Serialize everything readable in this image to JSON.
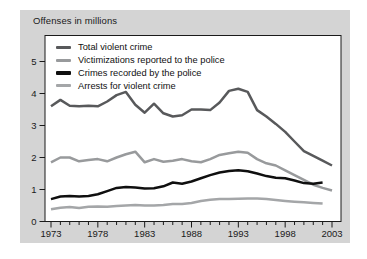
{
  "card": {
    "background": "#d4d4d4"
  },
  "chart_data": {
    "type": "line",
    "title": "Offenses in millions",
    "xlabel": "",
    "ylabel": "Offenses in millions",
    "x_start": 1973,
    "x_end": 2003,
    "x_ticks": [
      1973,
      1978,
      1983,
      1988,
      1993,
      1998,
      2003
    ],
    "y_ticks": [
      0,
      1,
      2,
      3,
      4,
      5
    ],
    "ylim": [
      0,
      5.8
    ],
    "grid": false,
    "legend_position": "top-left-inside",
    "plot_background": "#ffffff",
    "axis_color": "#1a1a1a",
    "series": [
      {
        "name": "Total violent crime",
        "color": "#58595b",
        "start_year": 1973,
        "values": [
          3.6,
          3.8,
          3.62,
          3.6,
          3.62,
          3.6,
          3.75,
          3.95,
          4.05,
          3.65,
          3.4,
          3.68,
          3.38,
          3.28,
          3.32,
          3.5,
          3.5,
          3.48,
          3.72,
          4.08,
          4.15,
          4.05,
          3.48,
          3.28,
          3.05,
          2.8,
          2.5,
          2.2,
          2.05,
          1.9,
          1.75
        ]
      },
      {
        "name": "Victimizations reported to the police",
        "color": "#989a9c",
        "start_year": 1973,
        "values": [
          1.85,
          2.0,
          2.0,
          1.88,
          1.92,
          1.95,
          1.88,
          2.0,
          2.1,
          2.18,
          1.85,
          1.95,
          1.87,
          1.9,
          1.95,
          1.88,
          1.85,
          1.95,
          2.08,
          2.13,
          2.18,
          2.15,
          1.95,
          1.82,
          1.75,
          1.6,
          1.45,
          1.3,
          1.15,
          1.05,
          0.97
        ]
      },
      {
        "name": "Crimes recorded by the police",
        "color": "#0f0f0f",
        "start_year": 1973,
        "values": [
          0.7,
          0.78,
          0.8,
          0.78,
          0.8,
          0.85,
          0.95,
          1.05,
          1.08,
          1.06,
          1.03,
          1.04,
          1.1,
          1.22,
          1.18,
          1.25,
          1.35,
          1.45,
          1.53,
          1.58,
          1.6,
          1.57,
          1.5,
          1.42,
          1.37,
          1.35,
          1.28,
          1.2,
          1.18,
          1.22
        ]
      },
      {
        "name": "Arrests for violent crime",
        "color": "#a4a6a8",
        "start_year": 1973,
        "values": [
          0.38,
          0.43,
          0.45,
          0.42,
          0.46,
          0.47,
          0.46,
          0.48,
          0.5,
          0.52,
          0.5,
          0.5,
          0.52,
          0.55,
          0.55,
          0.58,
          0.64,
          0.68,
          0.7,
          0.7,
          0.71,
          0.72,
          0.72,
          0.7,
          0.67,
          0.64,
          0.62,
          0.6,
          0.58,
          0.56
        ]
      }
    ]
  }
}
